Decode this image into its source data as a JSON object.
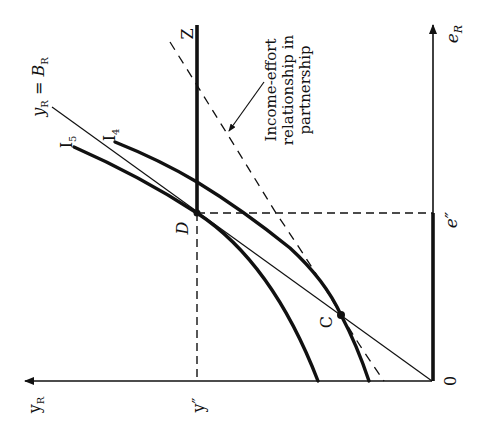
{
  "figure": {
    "orientation": "rotated 90 degrees counter-clockwise",
    "colors": {
      "ink": "#111111",
      "background": "#ffffff"
    },
    "axes": {
      "vertical_axis_label": "e",
      "vertical_axis_subscript": "R",
      "horizontal_axis_label": "y",
      "horizontal_axis_subscript": "R",
      "origin_label": "0"
    },
    "ticks": {
      "e_double_prime": "e″",
      "y_double_prime": "y″"
    },
    "points": {
      "D": "D",
      "C": "C"
    },
    "curves": {
      "I5_main": "I",
      "I5_sub": "5",
      "I4_main": "I",
      "I4_sub": "4",
      "budget_line_y": "y",
      "budget_line_y_sub": "R",
      "budget_line_eq": " = ",
      "budget_line_B": "B",
      "budget_line_B_sub": "R",
      "Z_label": "Z"
    },
    "annotation": {
      "line1": "Income-effort",
      "line2": "relationship in",
      "line3": "partnership"
    }
  }
}
